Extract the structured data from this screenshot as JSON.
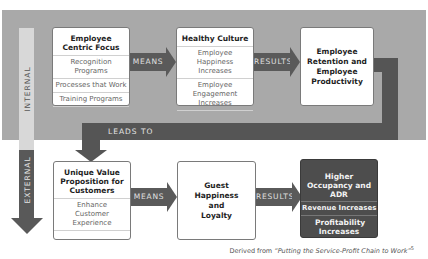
{
  "zones": {
    "internal_label": "INTERNAL",
    "external_label": "EXTERNAL"
  },
  "internal_row": {
    "box1": {
      "title": "Employee Centric Focus",
      "items": [
        "Recognition Programs",
        "Processes that Work",
        "Training Programs"
      ]
    },
    "arrow1": "MEANS",
    "box2": {
      "title": "Healthy Culture",
      "items": [
        "Employee Happiness Increases",
        "Employee Engagement Increases"
      ]
    },
    "arrow2": "RESULTS",
    "box3": {
      "title": "Employee Retention and Employee Productivity"
    }
  },
  "connector": {
    "label": "LEADS TO"
  },
  "external_row": {
    "box1": {
      "title": "Unique Value Proposition for Customers",
      "items": [
        "Enhance Customer Experience"
      ]
    },
    "arrow1": "MEANS",
    "box2": {
      "title": "Guest Happiness and Loyalty"
    },
    "arrow2": "RESULTS",
    "box3": {
      "items": [
        "Higher Occupancy and ADR",
        "Revenue Increases",
        "Profitability Increases"
      ]
    }
  },
  "caption": {
    "prefix": "Derived from ",
    "source": "“Putting the Service-Profit Chain to Work”",
    "footnote": "5"
  },
  "colors": {
    "internal_band": "#a9a9a9",
    "arrow_dark": "#5a5a5a",
    "results_box": "#4d4d4d"
  }
}
